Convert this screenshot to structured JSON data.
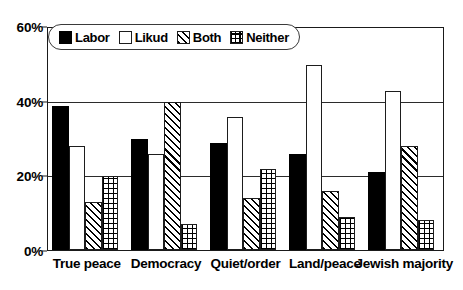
{
  "chart_data": {
    "type": "bar",
    "title": "",
    "subtitle": "",
    "xlabel": "",
    "ylabel": "",
    "categories": [
      "True peace",
      "Democracy",
      "Quiet/order",
      "Land/peace",
      "Jewish majority"
    ],
    "series": [
      {
        "name": "Labor",
        "values": [
          39,
          30,
          29,
          26,
          21
        ]
      },
      {
        "name": "Likud",
        "values": [
          28,
          26,
          36,
          50,
          43
        ]
      },
      {
        "name": "Both",
        "values": [
          13,
          40,
          14,
          16,
          28
        ]
      },
      {
        "name": "Neither",
        "values": [
          20,
          7,
          22,
          9,
          8
        ]
      }
    ],
    "ylim": [
      0,
      60
    ],
    "yticks": [
      0,
      20,
      40,
      60
    ],
    "ytick_labels": [
      "0%",
      "20%",
      "40%",
      "60%"
    ],
    "grid": true,
    "legend_position": "top-left",
    "colors": {
      "labor": "#000000",
      "likud": "#ffffff",
      "both": "#ffffff",
      "neither": "#ffffff",
      "outline": "#1d1d1d",
      "gridline": "#2b2b2b",
      "background": "#ffffff"
    },
    "patterns": {
      "labor": "solid-black",
      "likud": "empty-white",
      "both": "diagonal-hatch",
      "neither": "crosshatch-grid"
    }
  },
  "legend": {
    "items": [
      {
        "label": "Labor",
        "pattern": "solid-black"
      },
      {
        "label": "Likud",
        "pattern": "empty-white"
      },
      {
        "label": "Both",
        "pattern": "diagonal-hatch"
      },
      {
        "label": "Neither",
        "pattern": "crosshatch-grid"
      }
    ]
  }
}
